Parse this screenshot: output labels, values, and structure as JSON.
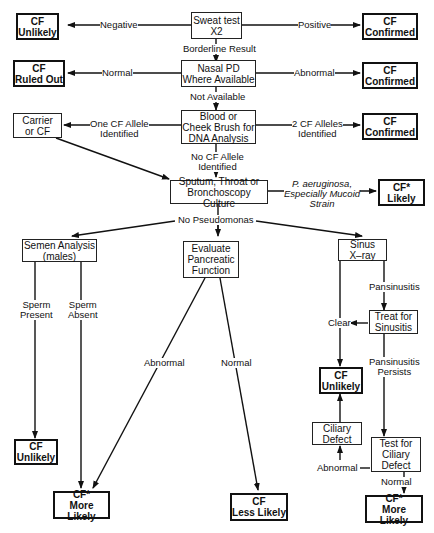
{
  "diagram": {
    "type": "flowchart",
    "nodes": {
      "sweat": "Sweat test\nX2",
      "cf_unlikely_1": "CF\nUnlikely",
      "cf_confirmed_1": "CF\nConfirmed",
      "nasal": "Nasal PD\nWhere Available",
      "cf_ruled_out": "CF\nRuled Out",
      "cf_confirmed_2": "CF\nConfirmed",
      "dna": "Blood or\nCheek Brush for\nDNA Analysis",
      "carrier": "Carrier\nor CF",
      "cf_confirmed_3": "CF\nConfirmed",
      "culture": "Sputum, Throat or\nBronchoscopy Culture",
      "cf_likely": "CF*\nLikely",
      "semen": "Semen Analysis\n(males)",
      "pancreatic": "Evaluate\nPancreatic\nFunction",
      "sinus": "Sinus\nX–ray",
      "treat": "Treat for\nSinusitis",
      "cf_unlikely_2": "CF\nUnlikely",
      "cf_unlikely_3": "CF\nUnlikely",
      "ciliary_defect": "Ciliary\nDefect",
      "test_ciliary": "Test for\nCiliary\nDefect",
      "cf_more_likely_1": "CF*\nMore Likely",
      "cf_less_likely": "CF\nLess Likely",
      "cf_more_likely_2": "CF*\nMore Likely"
    },
    "edge_labels": {
      "negative": "Negative",
      "positive": "Positive",
      "borderline": "Borderline Result",
      "normal_1": "Normal",
      "abnormal_1": "Abnormal",
      "not_available": "Not Available",
      "one_allele": "One CF Allele\nIdentified",
      "two_alleles": "2 CF Alleles\nIdentified",
      "no_allele": "No CF Allele\nIdentified",
      "pseudomonas": "P. aeruginosa,\nEspecially Mucoid\nStrain",
      "no_pseudomonas": "No Pseudomonas",
      "sperm_present": "Sperm\nPresent",
      "sperm_absent": "Sperm\nAbsent",
      "abnormal_2": "Abnormal",
      "normal_2": "Normal",
      "pansinusitis": "Pansinusitis",
      "clear": "Clear",
      "pansinusitis_persists": "Pansinusitis\nPersists",
      "abnormal_3": "Abnormal",
      "normal_3": "Normal"
    }
  }
}
